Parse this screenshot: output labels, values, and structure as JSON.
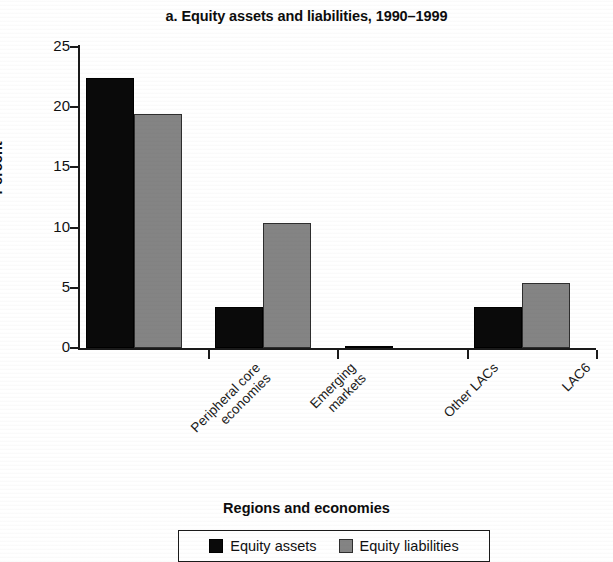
{
  "chart_data": {
    "type": "bar",
    "title": "a. Equity assets and liabilities, 1990–1999",
    "xlabel": "Regions and economies",
    "ylabel": "Percent",
    "ylim": [
      0,
      25
    ],
    "yticks": [
      0,
      5,
      10,
      15,
      20,
      25
    ],
    "ytick_labels": [
      "0",
      "5",
      "10",
      "15",
      "20",
      "25"
    ],
    "grid": false,
    "legend_position": "bottom",
    "categories": [
      "Peripheral core economies",
      "Emerging markets",
      "Other LACs",
      "LAC6"
    ],
    "category_lines": [
      [
        "Peripheral core",
        "economies"
      ],
      [
        "Emerging",
        "markets"
      ],
      [
        "Other LACs"
      ],
      [
        "LAC6"
      ]
    ],
    "series": [
      {
        "name": "Equity assets",
        "color": "#0a0a0a",
        "values": [
          22.4,
          3.4,
          0.2,
          3.4
        ]
      },
      {
        "name": "Equity liabilities",
        "color": "#848484",
        "values": [
          19.4,
          10.4,
          0.0,
          5.4
        ]
      }
    ]
  }
}
